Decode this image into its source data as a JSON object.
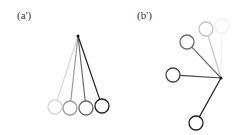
{
  "panels": [
    {
      "label": "(a')",
      "pivot": {
        "x": 78,
        "y": 36
      },
      "pendulums": [
        {
          "bob": {
            "x": 55,
            "y": 107
          },
          "color": "#d6d6d6"
        },
        {
          "bob": {
            "x": 70,
            "y": 108
          },
          "color": "#9a9a9a"
        },
        {
          "bob": {
            "x": 86,
            "y": 108
          },
          "color": "#6a6a6a"
        },
        {
          "bob": {
            "x": 102,
            "y": 106
          },
          "color": "#1e1e1e"
        }
      ]
    },
    {
      "label": "(b')",
      "pivot": {
        "x": 221,
        "y": 78
      },
      "pendulums": [
        {
          "bob": {
            "x": 222,
            "y": 26
          },
          "color": "#f0f0f0"
        },
        {
          "bob": {
            "x": 206,
            "y": 29
          },
          "color": "#c4c4c4"
        },
        {
          "bob": {
            "x": 187,
            "y": 42
          },
          "color": "#6a6a6a"
        },
        {
          "bob": {
            "x": 173,
            "y": 75
          },
          "color": "#444444"
        },
        {
          "bob": {
            "x": 196,
            "y": 123
          },
          "color": "#1e1e1e"
        }
      ]
    }
  ],
  "bob_radius": 7
}
